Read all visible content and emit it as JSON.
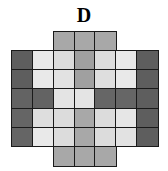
{
  "panel": {
    "title": "D",
    "background_color": "#ffffff",
    "border_color": "#1a1a1a"
  },
  "chart_data": {
    "type": "heatmap",
    "title": "D",
    "xlabel": "",
    "ylabel": "",
    "grid": true,
    "legend": "none",
    "rows": 7,
    "cols": 7,
    "row_labels": [
      "1",
      "2",
      "3",
      "4",
      "5",
      "6",
      "7"
    ],
    "col_labels": [
      "1",
      "2",
      "3",
      "4",
      "5",
      "6",
      "7"
    ],
    "shape": "octagon",
    "note": "Corner cells of top and bottom rows are blank (not part of the shape); only the centre three columns are drawn in rows 1 and 7.",
    "color_scale": {
      "type": "grayscale",
      "very_light": "#e8e8e8",
      "light": "#d8d8d8",
      "medium_light": "#c8c8c8",
      "medium": "#a8a8a8",
      "medium_dark": "#909090",
      "dark": "#6e6e6e",
      "very_dark": "#5a5a5a"
    },
    "values": [
      [
        null,
        null,
        0.4,
        0.4,
        0.4,
        null,
        null
      ],
      [
        0.72,
        0.1,
        0.18,
        0.44,
        0.18,
        0.1,
        0.72
      ],
      [
        0.72,
        0.1,
        0.12,
        0.44,
        0.16,
        0.1,
        0.72
      ],
      [
        0.72,
        0.72,
        0.08,
        0.08,
        0.68,
        0.68,
        0.72
      ],
      [
        0.7,
        0.14,
        0.18,
        0.44,
        0.16,
        0.1,
        0.72
      ],
      [
        0.7,
        0.1,
        0.18,
        0.44,
        0.16,
        0.12,
        0.72
      ],
      [
        null,
        null,
        0.4,
        0.4,
        0.4,
        null,
        null
      ]
    ],
    "colors": [
      [
        null,
        null,
        "#a8a8a8",
        "#a8a8a8",
        "#a8a8a8",
        null,
        null
      ],
      [
        "#5e5e5e",
        "#e9e9e9",
        "#dcdcdc",
        "#a0a0a0",
        "#dcdcdc",
        "#e9e9e9",
        "#5e5e5e"
      ],
      [
        "#5e5e5e",
        "#e9e9e9",
        "#e2e2e2",
        "#a0a0a0",
        "#dedede",
        "#e9e9e9",
        "#5e5e5e"
      ],
      [
        "#636363",
        "#636363",
        "#e4e4e4",
        "#e4e4e4",
        "#666666",
        "#666666",
        "#5e5e5e"
      ],
      [
        "#656565",
        "#dedede",
        "#dcdcdc",
        "#a8a8a8",
        "#dcdcdc",
        "#e6e6e6",
        "#5e5e5e"
      ],
      [
        "#656565",
        "#e9e9e9",
        "#dcdcdc",
        "#a8a8a8",
        "#dcdcdc",
        "#e2e2e2",
        "#5e5e5e"
      ],
      [
        null,
        null,
        "#a8a8a8",
        "#a8a8a8",
        "#a8a8a8",
        null,
        null
      ]
    ]
  }
}
